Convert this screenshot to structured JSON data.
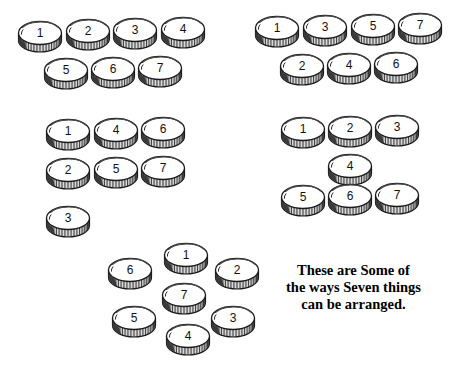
{
  "page": {
    "width": 464,
    "height": 375,
    "background": "#ffffff",
    "ink": "#1a1a1a"
  },
  "caption": {
    "line1": "These are Some of",
    "line2": "the ways Seven things",
    "line3": "can be arranged.",
    "x": 286,
    "y": 262
  },
  "arrangements": [
    {
      "id": "arrangement-four-three",
      "name": "four-over-three",
      "coins": [
        {
          "label": "1",
          "x": 40,
          "y": 37
        },
        {
          "label": "2",
          "x": 88,
          "y": 35
        },
        {
          "label": "3",
          "x": 135,
          "y": 34
        },
        {
          "label": "4",
          "x": 183,
          "y": 33
        },
        {
          "label": "5",
          "x": 66,
          "y": 74
        },
        {
          "label": "6",
          "x": 113,
          "y": 73
        },
        {
          "label": "7",
          "x": 160,
          "y": 72
        }
      ]
    },
    {
      "id": "arrangement-odds-evens",
      "name": "odds-over-evens",
      "coins": [
        {
          "label": "1",
          "x": 277,
          "y": 32
        },
        {
          "label": "3",
          "x": 325,
          "y": 31
        },
        {
          "label": "5",
          "x": 373,
          "y": 30
        },
        {
          "label": "7",
          "x": 420,
          "y": 29
        },
        {
          "label": "2",
          "x": 302,
          "y": 70
        },
        {
          "label": "4",
          "x": 349,
          "y": 69
        },
        {
          "label": "6",
          "x": 396,
          "y": 68
        }
      ]
    },
    {
      "id": "arrangement-two-rows-plus-one",
      "name": "two-rows-of-three-plus-one",
      "coins": [
        {
          "label": "1",
          "x": 68,
          "y": 135
        },
        {
          "label": "4",
          "x": 116,
          "y": 134
        },
        {
          "label": "6",
          "x": 163,
          "y": 133
        },
        {
          "label": "2",
          "x": 68,
          "y": 174
        },
        {
          "label": "5",
          "x": 116,
          "y": 173
        },
        {
          "label": "7",
          "x": 163,
          "y": 172
        },
        {
          "label": "3",
          "x": 68,
          "y": 222
        }
      ]
    },
    {
      "id": "arrangement-three-one-three",
      "name": "three-one-three",
      "coins": [
        {
          "label": "1",
          "x": 303,
          "y": 133
        },
        {
          "label": "2",
          "x": 350,
          "y": 132
        },
        {
          "label": "3",
          "x": 397,
          "y": 131
        },
        {
          "label": "4",
          "x": 350,
          "y": 170
        },
        {
          "label": "5",
          "x": 303,
          "y": 201
        },
        {
          "label": "6",
          "x": 350,
          "y": 200
        },
        {
          "label": "7",
          "x": 397,
          "y": 199
        }
      ]
    },
    {
      "id": "arrangement-hexagon-center",
      "name": "hexagon-with-center",
      "coins": [
        {
          "label": "1",
          "x": 186,
          "y": 259
        },
        {
          "label": "2",
          "x": 237,
          "y": 274
        },
        {
          "label": "3",
          "x": 233,
          "y": 322
        },
        {
          "label": "4",
          "x": 188,
          "y": 340
        },
        {
          "label": "5",
          "x": 134,
          "y": 322
        },
        {
          "label": "6",
          "x": 130,
          "y": 274
        },
        {
          "label": "7",
          "x": 184,
          "y": 299
        }
      ]
    }
  ]
}
